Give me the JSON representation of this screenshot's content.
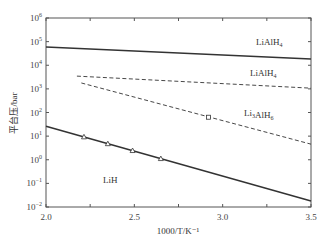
{
  "chart_data": {
    "type": "line",
    "title": "",
    "xlabel": "1000/T/K⁻¹",
    "ylabel": "平台压/bar",
    "xlim": [
      2.0,
      3.5
    ],
    "ylim_log10": [
      -2,
      6
    ],
    "yscale": "log",
    "x_ticks": [
      "2.0",
      "2.5",
      "3.0",
      "3.5"
    ],
    "y_ticks": [
      {
        "base": "10",
        "exp": "6"
      },
      {
        "base": "10",
        "exp": "5"
      },
      {
        "base": "10",
        "exp": "4"
      },
      {
        "base": "10",
        "exp": "3"
      },
      {
        "base": "10",
        "exp": "2"
      },
      {
        "base": "10",
        "exp": "1"
      },
      {
        "base": "10",
        "exp": "0"
      },
      {
        "base": "10",
        "exp": "−1"
      },
      {
        "base": "10",
        "exp": "−2"
      }
    ],
    "grid": false,
    "legend": "none (inline labels)",
    "series": [
      {
        "name": "LiAlH4",
        "label_main": "LiAlH",
        "label_sub": "4",
        "style": "solid",
        "x": [
          2.0,
          3.5
        ],
        "log10_y": [
          4.77,
          4.26
        ]
      },
      {
        "name": "LiAlH4",
        "label_main": "LiAlH",
        "label_sub": "4",
        "style": "dashed",
        "x": [
          2.175,
          3.5
        ],
        "log10_y": [
          3.54,
          3.03
        ]
      },
      {
        "name": "Li3AlH6",
        "label_main": "Li",
        "label_sub": "3",
        "label_main2": "AlH",
        "label_sub2": "6",
        "style": "dashed",
        "x": [
          2.2,
          3.5
        ],
        "log10_y": [
          3.25,
          0.66
        ],
        "markers": {
          "shape": "square",
          "x": [
            2.92
          ],
          "log10_y": [
            1.8
          ]
        }
      },
      {
        "name": "LiH",
        "label_main": "LiH",
        "style": "solid",
        "x": [
          2.0,
          3.5
        ],
        "log10_y": [
          1.42,
          -1.75
        ],
        "markers": {
          "shape": "triangle",
          "x": [
            2.215,
            2.35,
            2.49,
            2.65
          ],
          "log10_y": [
            0.97,
            0.68,
            0.39,
            0.05
          ]
        }
      }
    ]
  }
}
